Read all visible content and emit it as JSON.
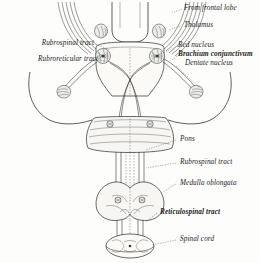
{
  "figure": {
    "background_color": "#fdfdfc",
    "ink_color": "#1a1a1a"
  },
  "labels": {
    "from_frontal_lobe": "From frontal lobe",
    "thalamus": "Thalamus",
    "red_nucleus": "Red nucleus",
    "brachium_conjunctivum": "Brachium conjunctivum",
    "dentate_nucleus": "Dentate nucleus",
    "rubrospinal_tract_left": "Rubrospinal tract",
    "rubroreticular_tract": "Rubroreticular tract",
    "pons": "Pons",
    "rubrospinal_tract_right": "Rubrospinal tract",
    "medulla_oblongata": "Medulla oblongata",
    "reticulospinal_tract": "Reticulospinal tract",
    "spinal_cord": "Spinal cord"
  },
  "structures": [
    {
      "name": "midbrain",
      "label": "Midbrain with red nuclei"
    },
    {
      "name": "pons",
      "label": "Pons"
    },
    {
      "name": "medulla-oblongata",
      "label": "Medulla oblongata"
    },
    {
      "name": "spinal-cord",
      "label": "Spinal cord"
    },
    {
      "name": "cerebellum-outline-left",
      "label": "Cerebellum outline left"
    },
    {
      "name": "cerebellum-outline-right",
      "label": "Cerebellum outline right"
    },
    {
      "name": "red-nucleus-left",
      "label": "Red nucleus left"
    },
    {
      "name": "red-nucleus-right",
      "label": "Red nucleus right"
    },
    {
      "name": "dentate-nucleus-left",
      "label": "Dentate nucleus left"
    },
    {
      "name": "dentate-nucleus-right",
      "label": "Dentate nucleus right"
    }
  ]
}
